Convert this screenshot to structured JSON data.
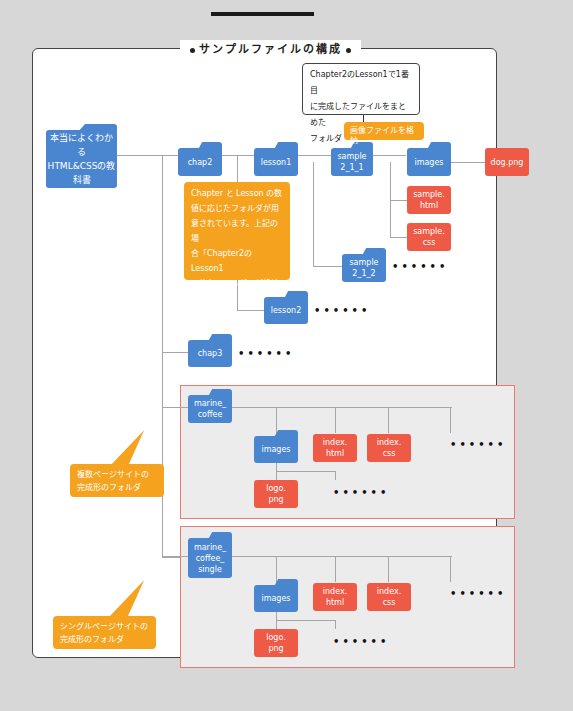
{
  "header": {
    "title": "サンプルファイルの構成"
  },
  "callout": {
    "text_lines": [
      "Chapter2のLesson1で1番目",
      "に完成したファイルをまとめた",
      "フォルダ"
    ]
  },
  "folders": {
    "root_line1": "本当によくわかる",
    "root_line2": "HTML&CSSの教科書",
    "chap2": "chap2",
    "lesson1": "lesson1",
    "sample_2_1_1_l1": "sample",
    "sample_2_1_1_l2": "2_1_1",
    "images_1": "images",
    "sample_2_1_2_l1": "sample",
    "sample_2_1_2_l2": "2_1_2",
    "lesson2": "lesson2",
    "chap3": "chap3",
    "marine_coffee_l1": "marine_",
    "marine_coffee_l2": "coffee",
    "images_2": "images",
    "marine_single_l1": "marine_",
    "marine_single_l2": "coffee_",
    "marine_single_l3": "single",
    "images_3": "images"
  },
  "files": {
    "dog_png": "dog.png",
    "sample_html_l1": "sample.",
    "sample_html_l2": "html",
    "sample_css_l1": "sample.",
    "sample_css_l2": "css",
    "index_html_l1": "index.",
    "index_html_l2": "html",
    "index_css_l1": "index.",
    "index_css_l2": "css",
    "logo_png_l1": "logo.",
    "logo_png_l2": "png",
    "index_html2_l1": "index.",
    "index_html2_l2": "html",
    "index_css2_l1": "index.",
    "index_css2_l2": "css",
    "logo_png2_l1": "logo.",
    "logo_png2_l2": "png"
  },
  "notes": {
    "images_note": "画像ファイルを格納",
    "chapter_note_lines": [
      "Chapter と Lesson の数",
      "値に応じたフォルダが用",
      "意されています。上記の場",
      "合「Chapter2のLesson1",
      "で使うフォルダ」が格納さ",
      "れています。"
    ],
    "multi_page_lines": [
      "複数ページサイトの",
      "完成形のフォルダ"
    ],
    "single_page_lines": [
      "シングルページサイトの",
      "完成形のフォルダ"
    ]
  },
  "ellipsis": "••••••",
  "colors": {
    "folder": "#4a86cf",
    "file": "#ee5a46",
    "note": "#f5a21e",
    "group_border": "#e87b6e",
    "connector": "#a6a6a6"
  }
}
